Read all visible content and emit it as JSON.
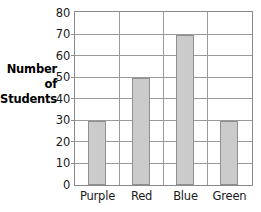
{
  "chart_data": {
    "type": "bar",
    "title": "",
    "xlabel": "",
    "ylabel": "Number of Students",
    "categories": [
      "Purple",
      "Red",
      "Blue",
      "Green"
    ],
    "values": [
      30,
      50,
      70,
      30
    ],
    "ylim": [
      0,
      80
    ],
    "ytick_step": 10,
    "yticks": [
      80,
      70,
      60,
      50,
      40,
      30,
      20,
      10,
      0
    ],
    "grid": "horizontal-and-vertical",
    "legend": "none",
    "bar_fill_color": "#cbcbcb",
    "bar_border_color": "#8f8f8f",
    "gridline_color": "#9a9a9a",
    "axis_color": "#8a8a8a",
    "background_color": "#ffffff"
  },
  "y_axis_title_lines": [
    "Number",
    "of",
    "Students"
  ]
}
